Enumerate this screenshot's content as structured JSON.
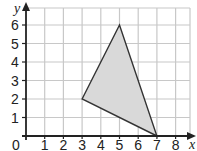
{
  "diagram": {
    "type": "coordinate-grid-triangle",
    "x_axis": {
      "label": "x",
      "ticks": [
        "0",
        "1",
        "2",
        "3",
        "4",
        "5",
        "6",
        "7",
        "8"
      ],
      "range": [
        0,
        8
      ]
    },
    "y_axis": {
      "label": "y",
      "ticks": [
        "1",
        "2",
        "3",
        "4",
        "5",
        "6"
      ],
      "range": [
        0,
        6
      ]
    },
    "triangle": {
      "vertices": [
        [
          3,
          2
        ],
        [
          5,
          6
        ],
        [
          7,
          0
        ]
      ],
      "fill": "#d9d9d9",
      "stroke": "#333333"
    },
    "colors": {
      "grid": "#c8c8c8",
      "axis": "#222222"
    }
  }
}
